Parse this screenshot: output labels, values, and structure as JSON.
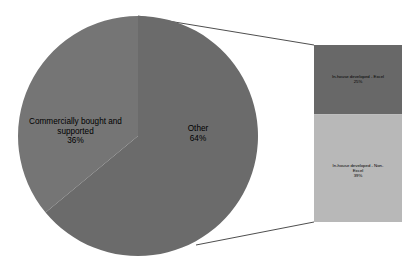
{
  "chart_data": {
    "type": "pie",
    "title": "",
    "subtitle": "",
    "xlabel": "",
    "ylabel": "",
    "legend": "none",
    "grid": false,
    "variant": "bar-of-pie",
    "pie": {
      "categories": [
        "Other",
        "Commercially bought and supported"
      ],
      "values": [
        64,
        36
      ],
      "labels": [
        "Other\n64%",
        "Commercially bought and supported\n36%"
      ],
      "colors": [
        "#6b6b6b",
        "#757575"
      ],
      "start_angle_deg": 0,
      "direction": "clockwise"
    },
    "bar": {
      "title": "",
      "categories": [
        "In-house developed - Excel",
        "In-house developed - Non-Excel"
      ],
      "values": [
        25,
        39
      ],
      "labels": [
        "In-house developed - Excel\n25%",
        "In-house developed - Non-Excel\n39%"
      ],
      "colors": [
        "#686868",
        "#b8b8b8"
      ],
      "parent_slice": "Other",
      "parent_total": 64
    }
  },
  "pie_labels": {
    "commercial": {
      "name": "Commercially bought and supported",
      "percent": "36%",
      "text": "Commercially bought and\nsupported\n36%"
    },
    "other": {
      "name": "Other",
      "percent": "64%",
      "text": "Other\n64%"
    }
  },
  "bar_labels": {
    "excel": {
      "name": "In-house developed - Excel",
      "percent": "25%",
      "text": "In-house developed - Excel\n25%"
    },
    "non_excel": {
      "name": "In-house developed - Non-Excel",
      "percent": "39%",
      "text": "In-house developed - Non-\nExcel\n39%"
    }
  },
  "colors": {
    "slice_other": "#6b6b6b",
    "slice_commercial": "#757575",
    "bar_excel": "#686868",
    "bar_non_excel": "#b8b8b8",
    "connector": "#3a3a3a",
    "background": "#ffffff",
    "label_text": "#000000"
  }
}
